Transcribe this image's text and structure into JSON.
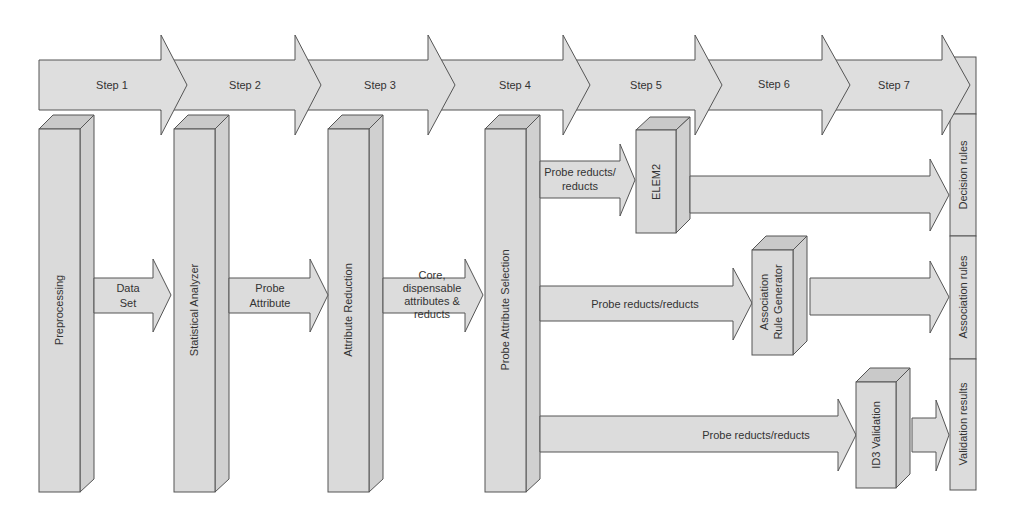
{
  "colors": {
    "fill": "#dcdcdc",
    "fill_side": "#cfcfcf",
    "fill_top": "#c8c8c8",
    "stroke": "#555555",
    "text": "#333333",
    "background": "#ffffff"
  },
  "steps": [
    {
      "label": "Step 1"
    },
    {
      "label": "Step 2"
    },
    {
      "label": "Step 3"
    },
    {
      "label": "Step 4"
    },
    {
      "label": "Step 5"
    },
    {
      "label": "Step 6"
    },
    {
      "label": "Step 7"
    }
  ],
  "modules": {
    "preprocessing": "Preprocessing",
    "statistical_analyzer": "Statistical Analyzer",
    "attribute_reduction": "Attribute Reduction",
    "probe_attribute_selection": "Probe Attribute Selection",
    "elem2": "ELEM2",
    "association_rule_generator": [
      "Association",
      "Rule Generator"
    ],
    "id3_validation": "ID3 Validation"
  },
  "flows": {
    "data_set": [
      "Data",
      "Set"
    ],
    "probe_attribute": [
      "Probe",
      "Attribute"
    ],
    "core_dispensable": [
      "Core,",
      "dispensable",
      "attributes &",
      "reducts"
    ],
    "to_elem2": [
      "Probe reducts/",
      "reducts"
    ],
    "to_assoc": "Probe reducts/reducts",
    "to_id3": "Probe reducts/reducts"
  },
  "outputs": {
    "decision_rules": "Decision rules",
    "association_rules": "Association rules",
    "validation_results": "Validation results"
  }
}
